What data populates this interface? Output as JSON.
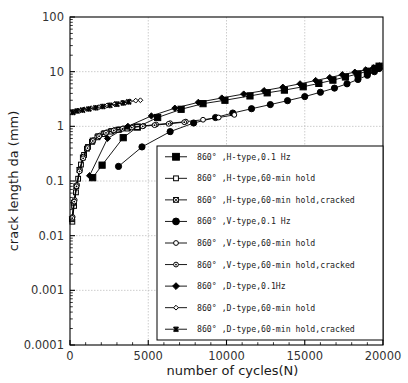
{
  "chart_data": {
    "type": "line",
    "title": "",
    "xlabel": "number of cycles(N)",
    "ylabel": "crack length da (mm)",
    "xlim": [
      0,
      20000
    ],
    "ylim": [
      0.0001,
      100
    ],
    "yscale": "log",
    "xscale": "linear",
    "grid": true,
    "xticks": [
      0,
      5000,
      10000,
      15000,
      20000
    ],
    "xticklabels": [
      "0",
      "5000",
      "10000",
      "15000",
      "20000"
    ],
    "yticks": [
      0.0001,
      0.001,
      0.01,
      0.1,
      1,
      10,
      100
    ],
    "yticklabels": [
      "0.0001",
      "0.001",
      "0.01",
      "0.1",
      "1",
      "10",
      "100"
    ],
    "legend_position": "lower-right-inside",
    "series": [
      {
        "name": "860° ,H-type,0.1 Hz",
        "marker": "filled-square",
        "points": [
          [
            1450,
            0.115
          ],
          [
            2050,
            0.195
          ],
          [
            3400,
            0.62
          ],
          [
            4300,
            0.97
          ],
          [
            5600,
            1.45
          ],
          [
            7100,
            2.05
          ],
          [
            8500,
            2.6
          ],
          [
            9900,
            3.0
          ],
          [
            11500,
            3.6
          ],
          [
            12600,
            4.1
          ],
          [
            13700,
            4.6
          ],
          [
            14900,
            5.3
          ],
          [
            15900,
            6.1
          ],
          [
            16800,
            7.0
          ],
          [
            17600,
            8.0
          ],
          [
            18400,
            9.1
          ],
          [
            19000,
            10.2
          ],
          [
            19500,
            11.5
          ],
          [
            19750,
            12.6
          ]
        ]
      },
      {
        "name": "860° ,H-type,60-min hold",
        "marker": "open-square",
        "points": [
          [
            150,
            0.018
          ],
          [
            260,
            0.035
          ],
          [
            380,
            0.062
          ],
          [
            520,
            0.11
          ],
          [
            700,
            0.2
          ],
          [
            900,
            0.3
          ],
          [
            1150,
            0.42
          ],
          [
            1450,
            0.55
          ],
          [
            1800,
            0.66
          ],
          [
            2200,
            0.75
          ],
          [
            2650,
            0.82
          ],
          [
            3150,
            0.88
          ],
          [
            3700,
            0.93
          ],
          [
            4300,
            0.97
          ]
        ]
      },
      {
        "name": "860° ,H-type,60-min hold,cracked",
        "marker": "crossed-square",
        "points": [
          [
            120,
            0.02
          ],
          [
            240,
            0.04
          ],
          [
            400,
            0.08
          ],
          [
            600,
            0.16
          ],
          [
            820,
            0.27
          ],
          [
            1080,
            0.39
          ],
          [
            1400,
            0.52
          ],
          [
            1750,
            0.63
          ],
          [
            2150,
            0.72
          ],
          [
            2600,
            0.8
          ],
          [
            3100,
            0.86
          ],
          [
            3650,
            0.91
          ]
        ]
      },
      {
        "name": "860° ,V-type,0.1 Hz",
        "marker": "filled-circle",
        "points": [
          [
            3100,
            0.185
          ],
          [
            4600,
            0.42
          ],
          [
            6400,
            0.8
          ],
          [
            7900,
            1.15
          ],
          [
            9300,
            1.45
          ],
          [
            10400,
            1.75
          ],
          [
            11600,
            2.1
          ],
          [
            12800,
            2.5
          ],
          [
            13900,
            2.95
          ],
          [
            15000,
            3.5
          ],
          [
            16000,
            4.2
          ],
          [
            16900,
            5.0
          ],
          [
            17700,
            6.0
          ],
          [
            18400,
            7.2
          ],
          [
            19000,
            8.6
          ],
          [
            19450,
            10.0
          ],
          [
            19750,
            11.4
          ]
        ]
      },
      {
        "name": "860° ,V-type,60-min hold",
        "marker": "open-circle",
        "points": [
          [
            170,
            0.022
          ],
          [
            300,
            0.045
          ],
          [
            450,
            0.085
          ],
          [
            640,
            0.16
          ],
          [
            870,
            0.28
          ],
          [
            1150,
            0.42
          ],
          [
            1500,
            0.56
          ],
          [
            1900,
            0.68
          ],
          [
            2350,
            0.78
          ],
          [
            2850,
            0.86
          ],
          [
            3400,
            0.92
          ],
          [
            4000,
            0.97
          ],
          [
            4700,
            1.02
          ],
          [
            5500,
            1.08
          ],
          [
            6400,
            1.14
          ],
          [
            7400,
            1.22
          ],
          [
            8500,
            1.32
          ],
          [
            9500,
            1.45
          ],
          [
            10500,
            1.62
          ]
        ]
      },
      {
        "name": "860° ,V-type,60-min hold,cracked",
        "marker": "dot-circle",
        "points": [
          [
            140,
            0.021
          ],
          [
            270,
            0.042
          ],
          [
            420,
            0.08
          ],
          [
            610,
            0.15
          ],
          [
            840,
            0.26
          ],
          [
            1120,
            0.4
          ],
          [
            1460,
            0.54
          ],
          [
            1860,
            0.66
          ],
          [
            2300,
            0.76
          ],
          [
            2800,
            0.84
          ],
          [
            3350,
            0.9
          ],
          [
            3950,
            0.95
          ],
          [
            4650,
            1.0
          ],
          [
            5400,
            1.05
          ],
          [
            6300,
            1.11
          ],
          [
            7300,
            1.19
          ]
        ]
      },
      {
        "name": "860° ,D-type,0.1Hz",
        "marker": "filled-diamond",
        "points": [
          [
            1250,
            0.125
          ],
          [
            2400,
            0.6
          ],
          [
            3700,
            1.0
          ],
          [
            5200,
            1.55
          ],
          [
            6700,
            2.15
          ],
          [
            8200,
            2.75
          ],
          [
            9700,
            3.3
          ],
          [
            11100,
            3.9
          ],
          [
            12400,
            4.5
          ],
          [
            13600,
            5.2
          ],
          [
            14700,
            6.0
          ],
          [
            15700,
            6.9
          ],
          [
            16600,
            7.8
          ],
          [
            17400,
            8.8
          ],
          [
            18200,
            9.8
          ],
          [
            18900,
            10.8
          ],
          [
            19400,
            11.8
          ],
          [
            19750,
            12.8
          ]
        ]
      },
      {
        "name": "860° ,D-type,60-min hold",
        "marker": "open-diamond",
        "points": [
          [
            200,
            1.85
          ],
          [
            500,
            1.95
          ],
          [
            900,
            2.05
          ],
          [
            1350,
            2.15
          ],
          [
            1850,
            2.25
          ],
          [
            2350,
            2.4
          ],
          [
            2850,
            2.55
          ],
          [
            3350,
            2.7
          ],
          [
            3800,
            2.85
          ],
          [
            4200,
            2.95
          ],
          [
            4500,
            3.0
          ]
        ]
      },
      {
        "name": "860° ,D-type,60-min hold,cracked",
        "marker": "star-x",
        "points": [
          [
            180,
            1.8
          ],
          [
            450,
            1.9
          ],
          [
            800,
            1.98
          ],
          [
            1200,
            2.08
          ],
          [
            1650,
            2.18
          ],
          [
            2100,
            2.3
          ],
          [
            2550,
            2.42
          ],
          [
            3000,
            2.55
          ],
          [
            3400,
            2.68
          ],
          [
            3750,
            2.8
          ]
        ]
      }
    ]
  },
  "legend": {
    "items": [
      {
        "label": "860° ,H-type,0.1 Hz",
        "marker": "filled-square"
      },
      {
        "label": "860° ,H-type,60-min hold",
        "marker": "open-square"
      },
      {
        "label": "860° ,H-type,60-min hold,cracked",
        "marker": "crossed-square"
      },
      {
        "label": "860° ,V-type,0.1 Hz",
        "marker": "filled-circle"
      },
      {
        "label": "860° ,V-type,60-min hold",
        "marker": "open-circle"
      },
      {
        "label": "860° ,V-type,60-min hold,cracked",
        "marker": "dot-circle"
      },
      {
        "label": "860° ,D-type,0.1Hz",
        "marker": "filled-diamond"
      },
      {
        "label": "860° ,D-type,60-min hold",
        "marker": "open-diamond"
      },
      {
        "label": "860° ,D-type,60-min hold,cracked",
        "marker": "star-x"
      }
    ]
  },
  "colors": {
    "line": "#000000",
    "axis": "#000000",
    "grid": "#b8b8b8",
    "background": "#ffffff",
    "text": "#222222"
  }
}
